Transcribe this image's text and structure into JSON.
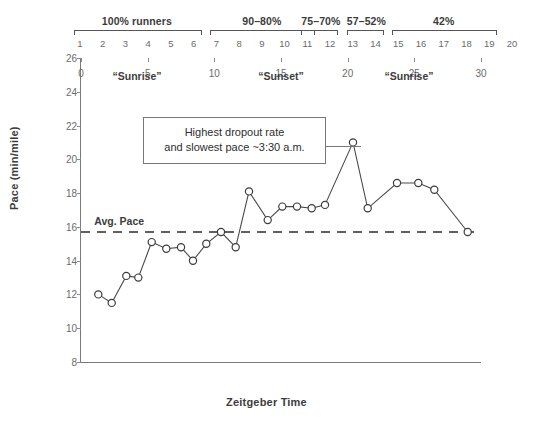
{
  "chart_data": {
    "type": "line",
    "title": "",
    "xlabel": "Zeitgeber Time",
    "ylabel": "Pace (min/mile)",
    "xlim": [
      0,
      30
    ],
    "ylim": [
      8,
      26
    ],
    "xticks": [
      "0",
      "5",
      "10",
      "15",
      "20",
      "25",
      "30"
    ],
    "yticks": [
      "8",
      "10",
      "12",
      "14",
      "16",
      "18",
      "20",
      "22",
      "24",
      "26"
    ],
    "grid": false,
    "legend": "none",
    "series": [
      {
        "name": "Pace",
        "x": [
          1.3,
          2.3,
          3.4,
          4.3,
          5.3,
          6.4,
          7.5,
          8.4,
          9.4,
          10.5,
          11.6,
          12.6,
          14.0,
          15.1,
          16.2,
          17.3,
          18.3,
          20.4,
          21.5,
          23.7,
          25.3,
          26.5,
          29.0
        ],
        "y": [
          12.0,
          11.5,
          13.1,
          13.0,
          15.1,
          14.7,
          14.8,
          14.0,
          15.0,
          15.7,
          14.8,
          18.1,
          16.4,
          17.2,
          17.2,
          17.1,
          17.3,
          21.0,
          17.1,
          18.6,
          18.6,
          18.2,
          15.7
        ]
      }
    ],
    "reference_line": {
      "label": "Avg. Pace",
      "value": 15.7,
      "style": "dashed"
    },
    "annotations": [
      {
        "name": "callout",
        "text": "Highest dropout rate and slowest pace ~3:30 a.m.",
        "line1": "Highest dropout rate",
        "line2": "and slowest pace ~3:30 a.m.",
        "points_to_x": 20.4,
        "points_to_y": 21.0
      },
      {
        "name": "phase-sunrise-1",
        "text": "“Sunrise”",
        "x": 4.2
      },
      {
        "name": "phase-sunset",
        "text": "“Sunset”",
        "x": 15.0
      },
      {
        "name": "phase-sunrise-2",
        "text": "“Sunrise”",
        "x": 24.6
      }
    ]
  },
  "top_axis": {
    "hour_ticks": [
      "1",
      "2",
      "3",
      "4",
      "5",
      "6",
      "7",
      "8",
      "9",
      "10",
      "11",
      "12",
      "13",
      "14",
      "15",
      "16",
      "17",
      "18",
      "19",
      "20"
    ],
    "groups": [
      {
        "label": "100% runners",
        "from": 1,
        "to": 6
      },
      {
        "label": "90–80%",
        "from": 7,
        "to": 11
      },
      {
        "label": "75–70%",
        "from": 11,
        "to": 12
      },
      {
        "label": "57–52%",
        "from": 13,
        "to": 14
      },
      {
        "label": "42%",
        "from": 15,
        "to": 19
      }
    ]
  },
  "colors": {
    "axis": "#7a7a7a",
    "line": "#4a4a4a",
    "marker_fill": "#ffffff",
    "marker_stroke": "#3c3c3c",
    "text": "#3c3c3c",
    "tick_text": "#6b6b6b",
    "callout_border": "#777777"
  }
}
